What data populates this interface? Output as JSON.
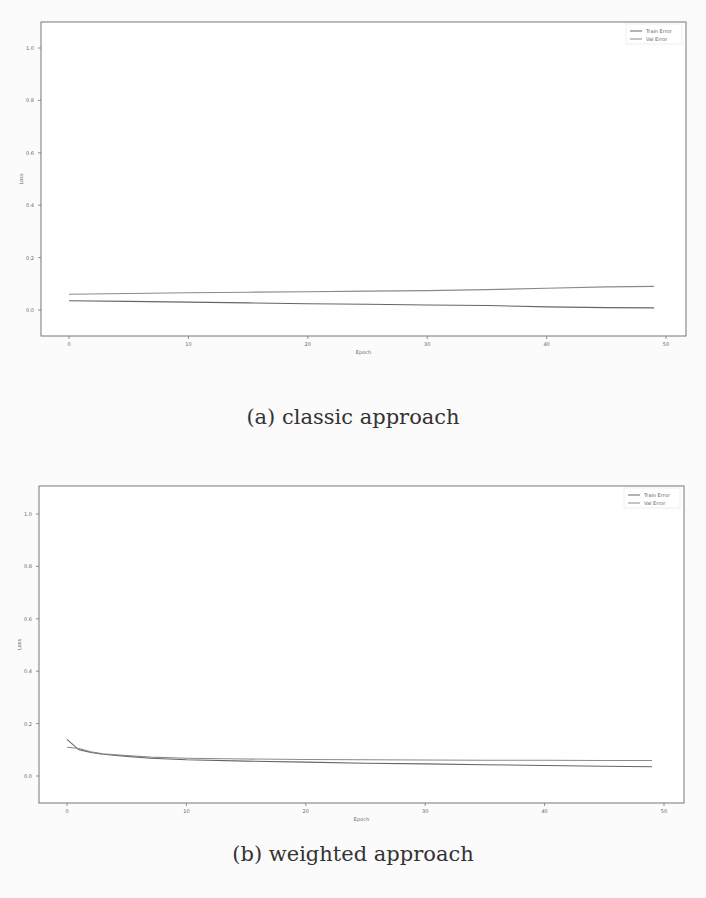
{
  "figures": [
    {
      "caption": "(a) classic approach",
      "xlabel": "Epoch",
      "ylabel": "Loss",
      "legend": [
        "Train Error",
        "Val Error"
      ]
    },
    {
      "caption": "(b) weighted approach",
      "xlabel": "Epoch",
      "ylabel": "Loss",
      "legend": [
        "Train Error",
        "Val Error"
      ]
    }
  ],
  "colors": {
    "frame": "#777777",
    "train": "#666666",
    "val": "#8a8a8a"
  },
  "chart_data": [
    {
      "type": "line",
      "title": "(a) classic approach",
      "xlabel": "Epoch",
      "ylabel": "Loss",
      "xlim": [
        -2.5,
        51.5
      ],
      "ylim": [
        -0.1,
        1.1
      ],
      "xticks": [
        0,
        10,
        20,
        30,
        40,
        50
      ],
      "yticks": [
        0.0,
        0.2,
        0.4,
        0.6,
        0.8,
        1.0
      ],
      "ytick_labels": [
        "0.0",
        "0.2",
        "0.4",
        "0.6",
        "0.8",
        "1.0"
      ],
      "grid": false,
      "legend_position": "upper right",
      "x": [
        0,
        5,
        10,
        15,
        20,
        25,
        30,
        35,
        40,
        45,
        49
      ],
      "series": [
        {
          "name": "Train Error",
          "values": [
            0.035,
            0.033,
            0.03,
            0.027,
            0.024,
            0.022,
            0.019,
            0.017,
            0.012,
            0.009,
            0.008
          ]
        },
        {
          "name": "Val Error",
          "values": [
            0.06,
            0.063,
            0.066,
            0.068,
            0.07,
            0.072,
            0.074,
            0.078,
            0.083,
            0.088,
            0.09
          ]
        }
      ]
    },
    {
      "type": "line",
      "title": "(b) weighted approach",
      "xlabel": "Epoch",
      "ylabel": "Loss",
      "xlim": [
        -2.5,
        51.5
      ],
      "ylim": [
        -0.1,
        1.1
      ],
      "xticks": [
        0,
        10,
        20,
        30,
        40,
        50
      ],
      "yticks": [
        0.0,
        0.2,
        0.4,
        0.6,
        0.8,
        1.0
      ],
      "ytick_labels": [
        "0.0",
        "0.2",
        "0.4",
        "0.6",
        "0.8",
        "1.0"
      ],
      "grid": false,
      "legend_position": "upper right",
      "x": [
        0,
        1,
        2,
        3,
        5,
        7,
        10,
        15,
        20,
        25,
        30,
        35,
        40,
        45,
        49
      ],
      "series": [
        {
          "name": "Train Error",
          "values": [
            0.14,
            0.1,
            0.09,
            0.083,
            0.075,
            0.068,
            0.062,
            0.057,
            0.053,
            0.049,
            0.046,
            0.043,
            0.04,
            0.037,
            0.035
          ]
        },
        {
          "name": "Val Error",
          "values": [
            0.11,
            0.105,
            0.092,
            0.085,
            0.078,
            0.072,
            0.068,
            0.065,
            0.063,
            0.062,
            0.061,
            0.06,
            0.06,
            0.059,
            0.059
          ]
        }
      ]
    }
  ]
}
